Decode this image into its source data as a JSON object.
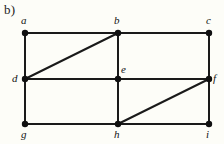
{
  "figure": {
    "caption": "b)",
    "background_color": "#fdfdf8",
    "edge_color": "#1a1a1a",
    "vertex_color": "#101010",
    "label_color": "#131313",
    "width": 224,
    "height": 144
  },
  "chart_data": {
    "type": "diagram",
    "title": "b)",
    "xlabel": "",
    "ylabel": "",
    "graph_kind": "undirected graph",
    "vertex_count": 9,
    "edge_count": 14,
    "vertices": [
      {
        "id": "a",
        "label": "a",
        "x": 25,
        "y": 33,
        "label_x": 21,
        "label_y": 15,
        "label_anchor": "above"
      },
      {
        "id": "b",
        "label": "b",
        "x": 118,
        "y": 33,
        "label_x": 114,
        "label_y": 15,
        "label_anchor": "above"
      },
      {
        "id": "c",
        "label": "c",
        "x": 209,
        "y": 33,
        "label_x": 206,
        "label_y": 15,
        "label_anchor": "above"
      },
      {
        "id": "d",
        "label": "d",
        "x": 25,
        "y": 79,
        "label_x": 12,
        "label_y": 73,
        "label_anchor": "left"
      },
      {
        "id": "e",
        "label": "e",
        "x": 118,
        "y": 79,
        "label_x": 121,
        "label_y": 64,
        "label_anchor": "above-right"
      },
      {
        "id": "f",
        "label": "f",
        "x": 209,
        "y": 79,
        "label_x": 213,
        "label_y": 73,
        "label_anchor": "right"
      },
      {
        "id": "g",
        "label": "g",
        "x": 25,
        "y": 124,
        "label_x": 21,
        "label_y": 129,
        "label_anchor": "below"
      },
      {
        "id": "h",
        "label": "h",
        "x": 118,
        "y": 124,
        "label_x": 114,
        "label_y": 129,
        "label_anchor": "below"
      },
      {
        "id": "i",
        "label": "i",
        "x": 209,
        "y": 124,
        "label_x": 206,
        "label_y": 129,
        "label_anchor": "below"
      }
    ],
    "edges": [
      {
        "from": "a",
        "to": "b",
        "kind": "horizontal"
      },
      {
        "from": "b",
        "to": "c",
        "kind": "horizontal"
      },
      {
        "from": "d",
        "to": "e",
        "kind": "horizontal"
      },
      {
        "from": "e",
        "to": "f",
        "kind": "horizontal"
      },
      {
        "from": "g",
        "to": "h",
        "kind": "horizontal"
      },
      {
        "from": "h",
        "to": "i",
        "kind": "horizontal"
      },
      {
        "from": "a",
        "to": "d",
        "kind": "vertical"
      },
      {
        "from": "d",
        "to": "g",
        "kind": "vertical"
      },
      {
        "from": "b",
        "to": "e",
        "kind": "vertical"
      },
      {
        "from": "e",
        "to": "h",
        "kind": "vertical"
      },
      {
        "from": "c",
        "to": "f",
        "kind": "vertical"
      },
      {
        "from": "f",
        "to": "i",
        "kind": "vertical"
      },
      {
        "from": "d",
        "to": "b",
        "kind": "diagonal"
      },
      {
        "from": "h",
        "to": "f",
        "kind": "diagonal"
      }
    ]
  }
}
